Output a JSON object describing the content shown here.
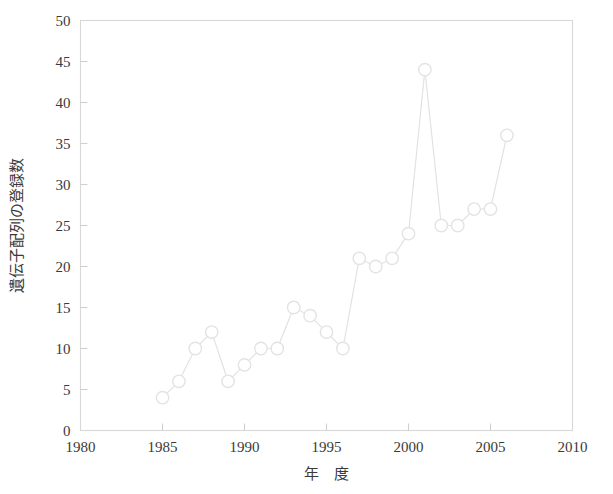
{
  "chart_data": {
    "type": "line",
    "title": "",
    "xlabel": "年　度",
    "ylabel": "遺伝子配列の登録数",
    "xlim": [
      1980,
      2010
    ],
    "ylim": [
      0,
      50
    ],
    "xticks": [
      1980,
      1985,
      1990,
      1995,
      2000,
      2005,
      2010
    ],
    "xtick_labels": [
      "1980",
      "1985",
      "1990",
      "1995",
      "2000",
      "2005",
      "2010"
    ],
    "yticks": [
      0,
      5,
      10,
      15,
      20,
      25,
      30,
      35,
      40,
      45,
      50
    ],
    "ytick_labels": [
      "0",
      "5",
      "10",
      "15",
      "20",
      "25",
      "30",
      "35",
      "40",
      "45",
      "50"
    ],
    "grid": false,
    "legend": null,
    "marker": "open-circle",
    "x": [
      1985,
      1986,
      1987,
      1988,
      1989,
      1990,
      1991,
      1992,
      1993,
      1994,
      1995,
      1996,
      1997,
      1998,
      1999,
      2000,
      2001,
      2002,
      2003,
      2004,
      2005,
      2006
    ],
    "values": [
      4,
      6,
      10,
      12,
      6,
      8,
      10,
      10,
      15,
      14,
      12,
      10,
      21,
      20,
      21,
      24,
      44,
      25,
      25,
      27,
      27,
      36
    ],
    "colors": {
      "line": "#e2e2e2",
      "marker_stroke": "#e3e3e3",
      "marker_fill": "#ffffff",
      "frame": "#d8d8d8",
      "text": "#3a3a3a",
      "background": "#ffffff"
    }
  }
}
